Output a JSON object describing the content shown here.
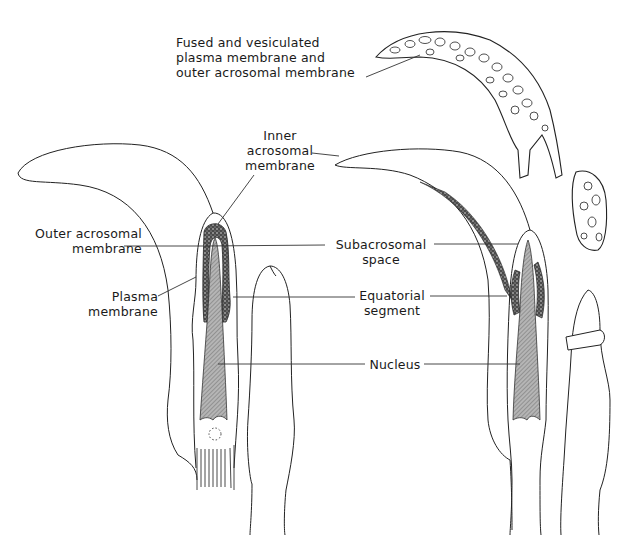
{
  "figure": {
    "labels": {
      "fused": [
        "Fused and vesiculated",
        "plasma membrane and",
        "outer acrosomal membrane"
      ],
      "inner": [
        "Inner",
        "acrosomal",
        "membrane"
      ],
      "outer": [
        "Outer acrosomal",
        "membrane"
      ],
      "plasma": [
        "Plasma",
        "membrane"
      ],
      "subacrosomal": [
        "Subacrosomal",
        "space"
      ],
      "equatorial": [
        "Equatorial",
        "segment"
      ],
      "nucleus": [
        "Nucleus"
      ]
    },
    "panels": [
      {
        "name": "intact-sperm",
        "position": "left"
      },
      {
        "name": "acrosome-reacted-sperm",
        "position": "right"
      }
    ],
    "colors": {
      "line": "#222222",
      "stipple": "#333333",
      "nucleus_hatch": "#8a8a8a",
      "background": "#ffffff"
    }
  }
}
